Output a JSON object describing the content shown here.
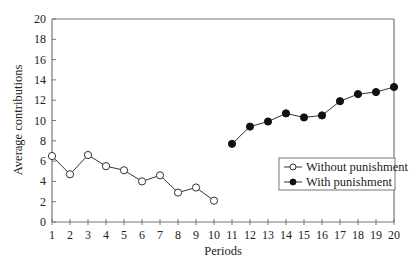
{
  "chart_data": {
    "type": "line",
    "title": "",
    "xlabel": "Periods",
    "ylabel": "Average contributions",
    "xlim": [
      1,
      20
    ],
    "ylim": [
      0,
      20
    ],
    "x_ticks": [
      1,
      2,
      3,
      4,
      5,
      6,
      7,
      8,
      9,
      10,
      11,
      12,
      13,
      14,
      15,
      16,
      17,
      18,
      19,
      20
    ],
    "y_ticks": [
      0,
      2,
      4,
      6,
      8,
      10,
      12,
      14,
      16,
      18,
      20
    ],
    "grid": false,
    "legend_position": "lower right inside",
    "series": [
      {
        "name": "Without punishment",
        "marker": "open-circle",
        "x": [
          1,
          2,
          3,
          4,
          5,
          6,
          7,
          8,
          9,
          10
        ],
        "values": [
          6.5,
          4.7,
          6.6,
          5.5,
          5.1,
          4.0,
          4.6,
          2.9,
          3.4,
          2.1
        ]
      },
      {
        "name": "With punishment",
        "marker": "filled-circle",
        "x": [
          11,
          12,
          13,
          14,
          15,
          16,
          17,
          18,
          19,
          20
        ],
        "values": [
          7.7,
          9.4,
          9.9,
          10.7,
          10.3,
          10.5,
          11.9,
          12.6,
          12.8,
          13.3
        ]
      }
    ]
  },
  "legend": {
    "items": [
      {
        "label": "Without punishment"
      },
      {
        "label": "With punishment"
      }
    ]
  },
  "colors": {
    "axis": "#777777",
    "line": "#333333",
    "marker_fill_filled": "#111111",
    "marker_fill_open": "#ffffff"
  }
}
